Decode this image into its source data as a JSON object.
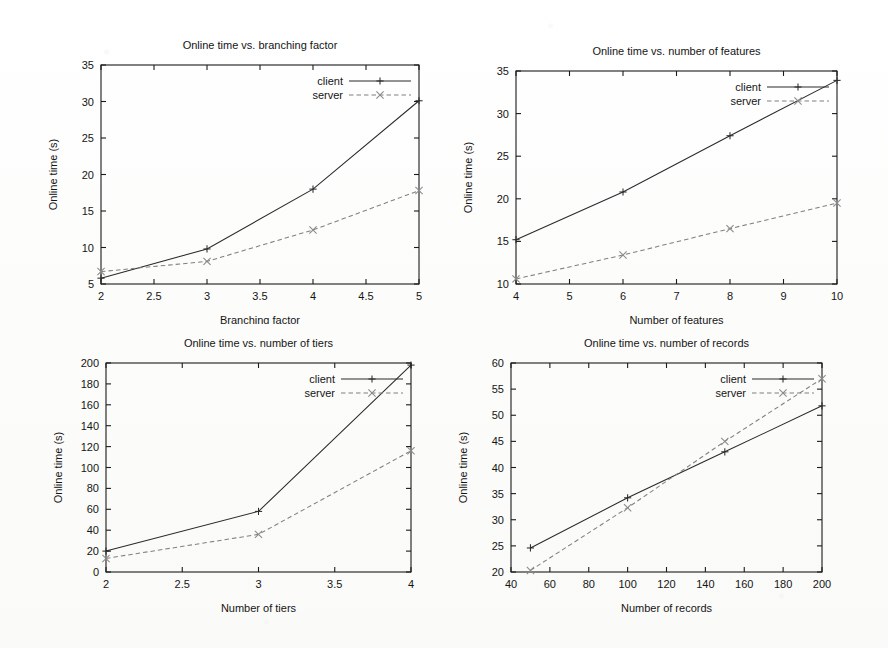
{
  "page": {
    "background": "#fdfdfc",
    "ink": "#1b1b1b",
    "client_color": "#2a2a2a",
    "server_color": "#808080"
  },
  "legend": {
    "client_label": "client",
    "server_label": "server",
    "client_marker": "plus-marker",
    "server_marker": "cross-marker"
  },
  "chart_data": [
    {
      "id": "branching-factor",
      "type": "line",
      "title": "Online time vs. branching factor",
      "xlabel": "Branching factor",
      "ylabel": "Online time (s)",
      "xlim": [
        2,
        5
      ],
      "ylim": [
        5,
        35
      ],
      "xticks": [
        2,
        2.5,
        3,
        3.5,
        4,
        4.5,
        5
      ],
      "xticklabels": [
        "2",
        "2.5",
        "3",
        "3.5",
        "4",
        "4.5",
        "5"
      ],
      "yticks": [
        5,
        10,
        15,
        20,
        25,
        30,
        35
      ],
      "yticklabels": [
        "5",
        "10",
        "15",
        "20",
        "25",
        "30",
        "35"
      ],
      "grid": false,
      "legend_position": "top-right",
      "x": [
        2,
        3,
        4,
        5
      ],
      "series": [
        {
          "name": "client",
          "values": [
            5.8,
            9.8,
            18.0,
            30.1
          ]
        },
        {
          "name": "server",
          "values": [
            6.7,
            8.1,
            12.4,
            17.8
          ]
        }
      ]
    },
    {
      "id": "number-of-features",
      "type": "line",
      "title": "Online time vs. number of features",
      "xlabel": "Number of features",
      "ylabel": "Online time (s)",
      "xlim": [
        4,
        10
      ],
      "ylim": [
        10,
        35
      ],
      "xticks": [
        4,
        5,
        6,
        7,
        8,
        9,
        10
      ],
      "xticklabels": [
        "4",
        "5",
        "6",
        "7",
        "8",
        "9",
        "10"
      ],
      "yticks": [
        10,
        15,
        20,
        25,
        30,
        35
      ],
      "yticklabels": [
        "10",
        "15",
        "20",
        "25",
        "30",
        "35"
      ],
      "grid": false,
      "legend_position": "top-right",
      "x": [
        4,
        6,
        8,
        10
      ],
      "series": [
        {
          "name": "client",
          "values": [
            15.2,
            20.8,
            27.4,
            33.9
          ]
        },
        {
          "name": "server",
          "values": [
            10.6,
            13.4,
            16.5,
            19.5
          ]
        }
      ]
    },
    {
      "id": "number-of-tiers",
      "type": "line",
      "title": "Online time vs. number of tiers",
      "xlabel": "Number of tiers",
      "ylabel": "Online time (s)",
      "xlim": [
        2,
        4
      ],
      "ylim": [
        0,
        200
      ],
      "xticks": [
        2,
        2.5,
        3,
        3.5,
        4
      ],
      "xticklabels": [
        "2",
        "2.5",
        "3",
        "3.5",
        "4"
      ],
      "yticks": [
        0,
        20,
        40,
        60,
        80,
        100,
        120,
        140,
        160,
        180,
        200
      ],
      "yticklabels": [
        "0",
        "20",
        "40",
        "60",
        "80",
        "100",
        "120",
        "140",
        "160",
        "180",
        "200"
      ],
      "grid": false,
      "legend_position": "top-right",
      "x": [
        2,
        3,
        4
      ],
      "series": [
        {
          "name": "client",
          "values": [
            20,
            58,
            198
          ]
        },
        {
          "name": "server",
          "values": [
            13,
            36,
            116
          ]
        }
      ]
    },
    {
      "id": "number-of-records",
      "type": "line",
      "title": "Online time vs. number of records",
      "xlabel": "Number of records",
      "ylabel": "Online time (s)",
      "xlim": [
        40,
        200
      ],
      "ylim": [
        20,
        60
      ],
      "xticks": [
        40,
        60,
        80,
        100,
        120,
        140,
        160,
        180,
        200
      ],
      "xticklabels": [
        "40",
        "60",
        "80",
        "100",
        "120",
        "140",
        "160",
        "180",
        "200"
      ],
      "yticks": [
        20,
        25,
        30,
        35,
        40,
        45,
        50,
        55,
        60
      ],
      "yticklabels": [
        "20",
        "25",
        "30",
        "35",
        "40",
        "45",
        "50",
        "55",
        "60"
      ],
      "grid": false,
      "legend_position": "top-right",
      "x": [
        50,
        100,
        150,
        200
      ],
      "series": [
        {
          "name": "client",
          "values": [
            24.6,
            34.2,
            43.0,
            51.8
          ]
        },
        {
          "name": "server",
          "values": [
            20.3,
            32.3,
            45.0,
            57.0
          ]
        }
      ]
    }
  ]
}
